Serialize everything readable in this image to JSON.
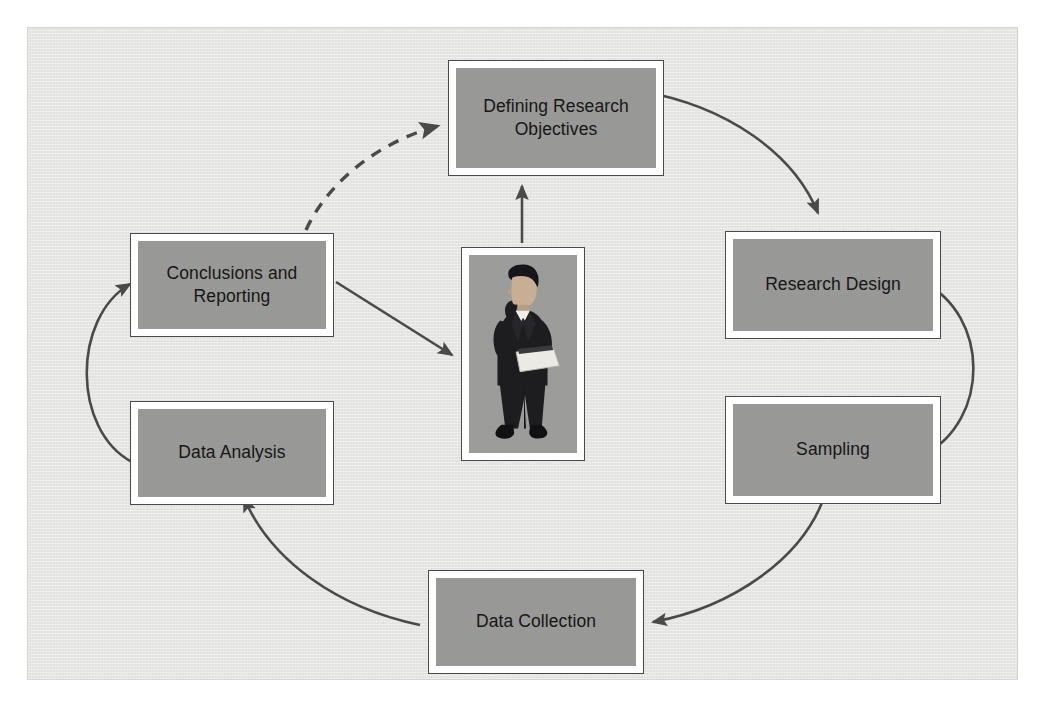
{
  "figure": {
    "background_color": "#e9e9e7",
    "node_fill_color": "#999997",
    "node_border_color": "#4a4a4a",
    "arrow_color": "#4a4a4a",
    "text_color": "#161616"
  },
  "nodes": [
    {
      "id": "defining-research-objectives",
      "label": "Defining Research\nObjectives",
      "x": 420,
      "y": 32,
      "width": 216,
      "height": 116
    },
    {
      "id": "research-design",
      "label": "Research Design",
      "x": 697,
      "y": 203,
      "width": 216,
      "height": 108
    },
    {
      "id": "sampling",
      "label": "Sampling",
      "x": 697,
      "y": 368,
      "width": 216,
      "height": 108
    },
    {
      "id": "data-collection",
      "label": "Data Collection",
      "x": 400,
      "y": 542,
      "width": 216,
      "height": 104
    },
    {
      "id": "data-analysis",
      "label": "Data Analysis",
      "x": 102,
      "y": 373,
      "width": 204,
      "height": 104
    },
    {
      "id": "conclusions-and-reporting",
      "label": "Conclusions and\nReporting",
      "x": 102,
      "y": 205,
      "width": 204,
      "height": 104
    }
  ],
  "center_photo": {
    "id": "businessman-photo",
    "alt": "Businessman in dark suit holding documents, thinking",
    "x": 433,
    "y": 219,
    "width": 124,
    "height": 214,
    "suit_color": "#1d1d1f",
    "skin_color": "#c7ae94",
    "paper_color": "#eceae4"
  },
  "connections": [
    {
      "id": "objectives-to-design",
      "from": "defining-research-objectives",
      "to": "research-design",
      "style": "solid"
    },
    {
      "id": "design-to-sampling",
      "from": "research-design",
      "to": "sampling",
      "style": "solid"
    },
    {
      "id": "sampling-to-data-collection",
      "from": "sampling",
      "to": "data-collection",
      "style": "solid"
    },
    {
      "id": "data-collection-to-data-analysis",
      "from": "data-collection",
      "to": "data-analysis",
      "style": "solid"
    },
    {
      "id": "data-analysis-to-conclusions",
      "from": "data-analysis",
      "to": "conclusions-and-reporting",
      "style": "solid"
    },
    {
      "id": "conclusions-to-objectives",
      "from": "conclusions-and-reporting",
      "to": "defining-research-objectives",
      "style": "dashed"
    },
    {
      "id": "conclusions-to-researcher",
      "from": "conclusions-and-reporting",
      "to": "businessman-photo",
      "style": "solid"
    },
    {
      "id": "researcher-to-objectives",
      "from": "businessman-photo",
      "to": "defining-research-objectives",
      "style": "solid"
    }
  ]
}
